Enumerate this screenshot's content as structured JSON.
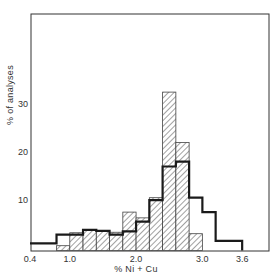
{
  "chart_data": {
    "type": "bar",
    "subtype": "overlaid-step-histogram",
    "title": "",
    "xlabel": "% Ni + Cu",
    "ylabel": "% of analyses",
    "xlim": [
      0.4,
      3.9
    ],
    "ylim": [
      0,
      41
    ],
    "grid": false,
    "legend": null,
    "x_ticks": [
      {
        "value": 0.4,
        "label": "0.4"
      },
      {
        "value": 1.0,
        "label": "1.0"
      },
      {
        "value": 2.0,
        "label": "2.0"
      },
      {
        "value": 3.0,
        "label": "3.0"
      },
      {
        "value": 3.6,
        "label": "3.6"
      }
    ],
    "y_ticks": [
      {
        "value": 10,
        "label": "10"
      },
      {
        "value": 20,
        "label": "20"
      },
      {
        "value": 30,
        "label": "30"
      }
    ],
    "series": [
      {
        "name": "hatched",
        "style": "hatched-fill",
        "bins": [
          {
            "from": 0.8,
            "to": 1.0,
            "value": 1.0
          },
          {
            "from": 1.0,
            "to": 1.2,
            "value": 3.7
          },
          {
            "from": 1.2,
            "to": 1.4,
            "value": 4.2
          },
          {
            "from": 1.4,
            "to": 1.6,
            "value": 4.0
          },
          {
            "from": 1.6,
            "to": 1.8,
            "value": 3.8
          },
          {
            "from": 1.8,
            "to": 2.0,
            "value": 8.0
          },
          {
            "from": 2.0,
            "to": 2.2,
            "value": 6.8
          },
          {
            "from": 2.2,
            "to": 2.4,
            "value": 11.0
          },
          {
            "from": 2.4,
            "to": 2.6,
            "value": 33.0
          },
          {
            "from": 2.6,
            "to": 2.8,
            "value": 22.5
          },
          {
            "from": 2.8,
            "to": 3.0,
            "value": 3.5
          }
        ]
      },
      {
        "name": "outline",
        "style": "heavy-step-line",
        "bins": [
          {
            "from": 0.4,
            "to": 0.8,
            "value": 1.5
          },
          {
            "from": 0.8,
            "to": 1.0,
            "value": 3.3
          },
          {
            "from": 1.0,
            "to": 1.2,
            "value": 3.3
          },
          {
            "from": 1.2,
            "to": 1.4,
            "value": 4.3
          },
          {
            "from": 1.4,
            "to": 1.6,
            "value": 4.1
          },
          {
            "from": 1.6,
            "to": 1.8,
            "value": 3.3
          },
          {
            "from": 1.8,
            "to": 2.0,
            "value": 4.0
          },
          {
            "from": 2.0,
            "to": 2.2,
            "value": 6.0
          },
          {
            "from": 2.2,
            "to": 2.4,
            "value": 10.5
          },
          {
            "from": 2.4,
            "to": 2.6,
            "value": 17.5
          },
          {
            "from": 2.6,
            "to": 2.8,
            "value": 18.5
          },
          {
            "from": 2.8,
            "to": 3.0,
            "value": 11.0
          },
          {
            "from": 3.0,
            "to": 3.2,
            "value": 8.0
          },
          {
            "from": 3.2,
            "to": 3.6,
            "value": 2.0
          }
        ]
      }
    ]
  },
  "colors": {
    "ink": "#222222",
    "frame": "#333333",
    "hatch": "#444444",
    "background": "#ffffff"
  }
}
